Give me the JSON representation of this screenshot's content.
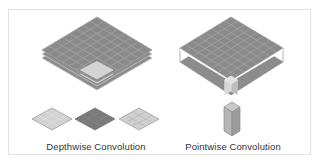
{
  "figure": {
    "left_panel": {
      "caption": "Depthwise Convolution",
      "stack_layers": 3,
      "grid_size": 8,
      "kernel_slices": 3
    },
    "right_panel": {
      "caption": "Pointwise Convolution",
      "grid_size": 8,
      "kernel": "1x1xC column"
    },
    "colors": {
      "grid_fill": "#8a8a8a",
      "grid_line": "#a8a8a8",
      "highlight": "#d4d4d4",
      "dark_slice": "#7a7a7a",
      "light_slice": "#d2d2d2",
      "border": "#e2e2e2"
    }
  }
}
